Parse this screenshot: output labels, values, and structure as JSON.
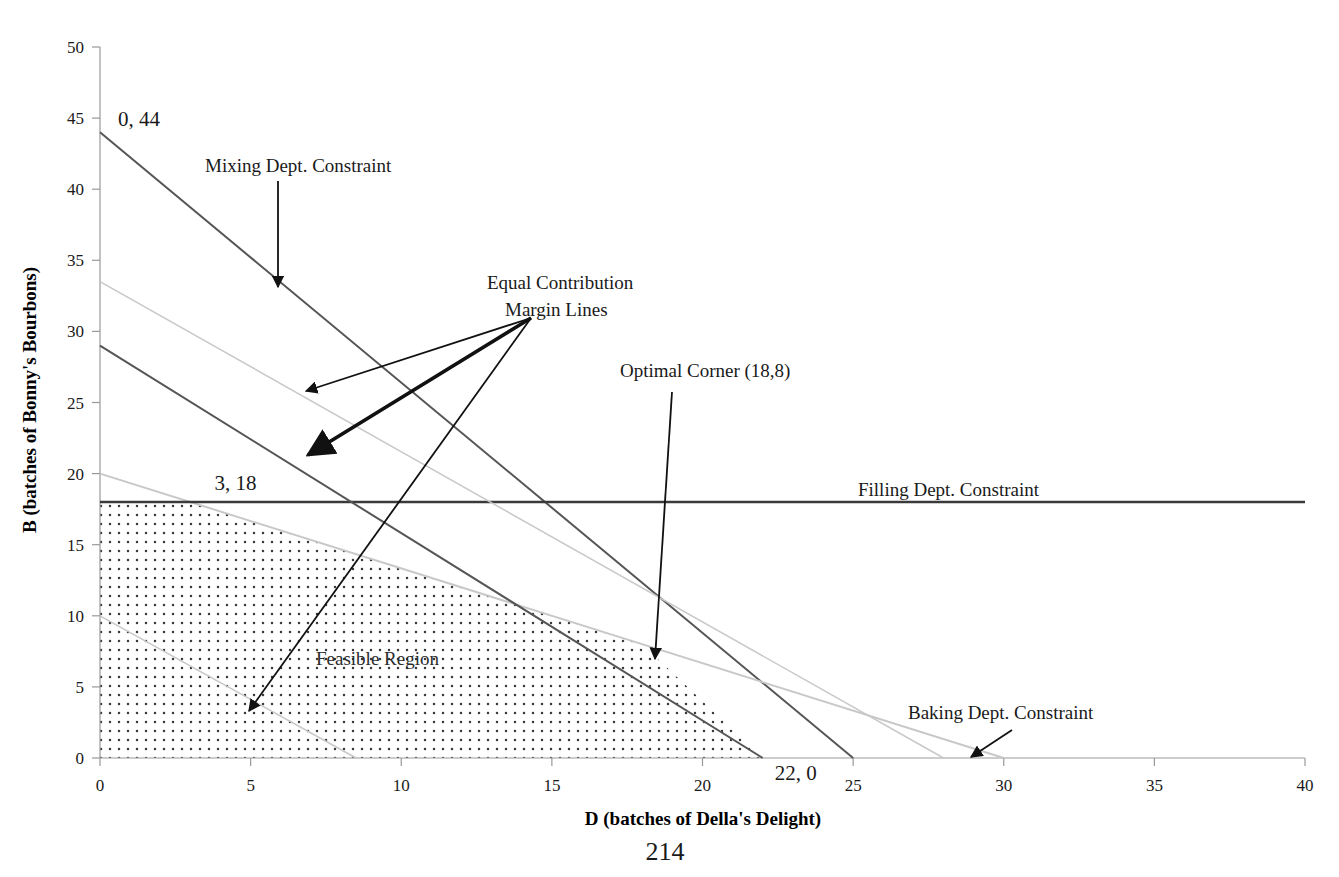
{
  "page": {
    "page_number": "214"
  },
  "chart_data": {
    "type": "line",
    "title": "",
    "xlabel": "D (batches of Della's Delight)",
    "ylabel": "B (batches of Bonny's Bourbons)",
    "xlim": [
      0,
      40
    ],
    "ylim": [
      0,
      50
    ],
    "xticks": [
      0,
      5,
      10,
      15,
      20,
      25,
      30,
      35,
      40
    ],
    "yticks": [
      0,
      5,
      10,
      15,
      20,
      25,
      30,
      35,
      40,
      45,
      50
    ],
    "xtick_labels": [
      "0",
      "5",
      "10",
      "15",
      "20",
      "25",
      "30",
      "35",
      "40"
    ],
    "ytick_labels": [
      "0",
      "5",
      "10",
      "15",
      "20",
      "25",
      "30",
      "35",
      "40",
      "45",
      "50"
    ],
    "grid": false,
    "legend": "none",
    "series": [
      {
        "name": "Mixing Dept. Constraint",
        "kind": "constraint",
        "color": "#555555",
        "width": 2,
        "points": [
          [
            0,
            44
          ],
          [
            25,
            0
          ]
        ]
      },
      {
        "name": "Baking Dept. Constraint",
        "kind": "constraint",
        "color": "#c8c8c8",
        "width": 2,
        "points": [
          [
            0,
            20
          ],
          [
            30,
            0
          ]
        ]
      },
      {
        "name": "Filling Dept. Constraint",
        "kind": "constraint",
        "color": "#3a3a3a",
        "width": 2.5,
        "points": [
          [
            0,
            18
          ],
          [
            40,
            18
          ]
        ]
      },
      {
        "name": "Equal Contribution Margin Line 1",
        "kind": "iso-profit",
        "color": "#c8c8c8",
        "width": 1.5,
        "points": [
          [
            0,
            33.5
          ],
          [
            28,
            0
          ]
        ]
      },
      {
        "name": "Equal Contribution Margin Line 2",
        "kind": "iso-profit",
        "color": "#555555",
        "width": 2,
        "points": [
          [
            0,
            29
          ],
          [
            22,
            0
          ]
        ]
      },
      {
        "name": "Equal Contribution Margin Line 3",
        "kind": "iso-profit",
        "color": "#c8c8c8",
        "width": 1.5,
        "points": [
          [
            0,
            10
          ],
          [
            8.5,
            0
          ]
        ]
      }
    ],
    "feasible_region": {
      "label": "Feasible Region",
      "fill": "dotted",
      "vertices": [
        [
          0,
          0
        ],
        [
          0,
          18
        ],
        [
          3,
          18
        ],
        [
          18,
          8
        ],
        [
          22,
          0
        ]
      ]
    },
    "point_labels": [
      {
        "text": "0, 44",
        "x": 0,
        "y": 44
      },
      {
        "text": "3, 18",
        "x": 3,
        "y": 18
      },
      {
        "text": "22, 0",
        "x": 22,
        "y": 0
      }
    ],
    "annotations": [
      {
        "text": "Mixing Dept. Constraint",
        "label_x": 205,
        "label_y": 172,
        "arrows": [
          {
            "from": [
              278,
              181
            ],
            "to": [
              278,
              287
            ]
          }
        ]
      },
      {
        "text_line1": "Equal Contribution",
        "text_line2": "Margin Lines",
        "label_x": 487,
        "label_y": 289,
        "arrows": [
          {
            "from": [
              531,
              318
            ],
            "to": [
              306,
              391
            ]
          },
          {
            "from": [
              531,
              318
            ],
            "to": [
              308,
              455
            ]
          },
          {
            "from": [
              531,
              318
            ],
            "to": [
              249,
              711
            ]
          }
        ]
      },
      {
        "text": "Optimal Corner (18,8)",
        "label_x": 620,
        "label_y": 377,
        "arrows": [
          {
            "from": [
              672,
              392
            ],
            "to": [
              655,
              659
            ]
          }
        ]
      },
      {
        "text": "Filling Dept. Constraint",
        "label_x": 858,
        "label_y": 496,
        "arrows": []
      },
      {
        "text": "Baking Dept. Constraint",
        "label_x": 908,
        "label_y": 719,
        "arrows": [
          {
            "from": [
              1012,
              730
            ],
            "to": [
              971,
              757
            ]
          }
        ]
      }
    ]
  }
}
